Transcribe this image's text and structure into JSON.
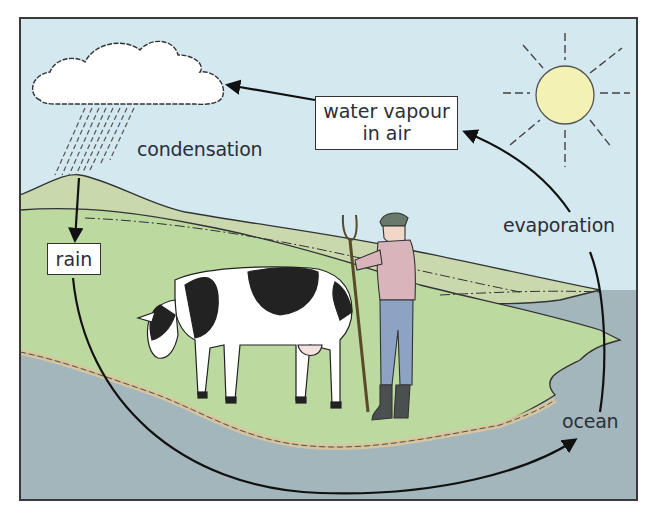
{
  "diagram": {
    "colors": {
      "sky": "#d3e8ef",
      "hill": "#c9d9ad",
      "grass": "#bcd9a0",
      "ocean": "#a3b6bb",
      "sun": "#f3f2b4",
      "cloud": "#ffffff",
      "frame": "#3a3a3a",
      "arrow": "#111111",
      "text": "#2b2f3a"
    },
    "labels": {
      "water_vapour_line1": "water vapour",
      "water_vapour_line2": "in air",
      "condensation": "condensation",
      "evaporation": "evaporation",
      "rain": "rain",
      "ocean": "ocean"
    },
    "illustrations": [
      "cloud-with-rain",
      "sun",
      "cow",
      "farmer-with-pitchfork",
      "grassy-headland",
      "ocean"
    ],
    "flow": [
      {
        "from": "ocean",
        "to": "water vapour in air",
        "label": "evaporation"
      },
      {
        "from": "water vapour in air",
        "to": "cloud",
        "label": "condensation"
      },
      {
        "from": "cloud",
        "to": "rain",
        "label": ""
      },
      {
        "from": "rain",
        "to": "ocean",
        "label": ""
      }
    ]
  }
}
